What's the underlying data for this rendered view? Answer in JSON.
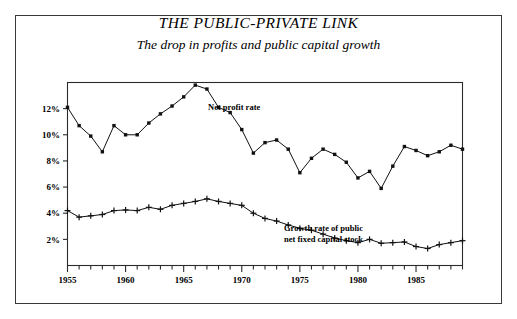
{
  "chart_data": {
    "type": "line",
    "title": "THE PUBLIC-PRIVATE LINK",
    "subtitle": "The drop in profits and public capital growth",
    "xlabel": "",
    "ylabel": "",
    "grid": false,
    "legend_position": "inline-annotation",
    "xlim": [
      1955,
      1989
    ],
    "ylim": [
      0,
      14
    ],
    "x": [
      1955,
      1956,
      1957,
      1958,
      1959,
      1960,
      1961,
      1962,
      1963,
      1964,
      1965,
      1966,
      1967,
      1968,
      1969,
      1970,
      1971,
      1972,
      1973,
      1974,
      1975,
      1976,
      1977,
      1978,
      1979,
      1980,
      1981,
      1982,
      1983,
      1984,
      1985,
      1986,
      1987,
      1988,
      1989
    ],
    "xticklabels": [
      "1955",
      "1960",
      "1965",
      "1970",
      "1975",
      "1980",
      "1985"
    ],
    "xtickvalues": [
      1955,
      1960,
      1965,
      1970,
      1975,
      1980,
      1985
    ],
    "yticklabels": [
      "2%",
      "4%",
      "6%",
      "8%",
      "10%",
      "12%"
    ],
    "ytickvalues": [
      2,
      4,
      6,
      8,
      10,
      12
    ],
    "series": [
      {
        "name": "Net profit rate",
        "marker": "square",
        "annotation": "Net profit rate",
        "values": [
          12.1,
          10.7,
          9.9,
          8.7,
          10.7,
          10.0,
          10.0,
          10.9,
          11.6,
          12.2,
          12.9,
          13.8,
          13.5,
          12.1,
          11.7,
          10.4,
          8.6,
          9.4,
          9.6,
          8.9,
          7.1,
          8.2,
          8.9,
          8.5,
          7.9,
          6.7,
          7.2,
          5.9,
          7.6,
          9.1,
          8.8,
          8.4,
          8.7,
          9.2,
          8.9
        ]
      },
      {
        "name": "Growth rate of public net fixed capital stock",
        "marker": "plus",
        "annotation_line1": "Growth rate of public",
        "annotation_line2": "net fixed capital stock",
        "values": [
          4.2,
          3.7,
          3.8,
          3.9,
          4.2,
          4.25,
          4.2,
          4.45,
          4.3,
          4.6,
          4.75,
          4.9,
          5.1,
          4.9,
          4.75,
          4.6,
          4.0,
          3.6,
          3.4,
          3.1,
          2.85,
          2.7,
          2.4,
          2.1,
          1.9,
          1.75,
          2.0,
          1.7,
          1.75,
          1.8,
          1.45,
          1.3,
          1.6,
          1.75,
          1.9
        ]
      }
    ]
  }
}
